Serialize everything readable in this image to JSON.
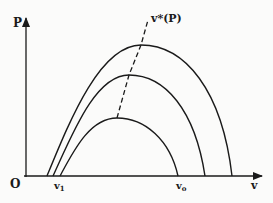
{
  "diagram": {
    "type": "family-of-curves",
    "axes": {
      "y_label": "P",
      "x_label": "v",
      "origin_label": "O"
    },
    "x_ticks": [
      {
        "label": "v",
        "subscript": "1"
      },
      {
        "label": "v",
        "subscript": "o"
      }
    ],
    "locus_label": "v*(P)",
    "curves": [
      {
        "name": "inner-curve",
        "start": "v1",
        "end": "vo"
      },
      {
        "name": "middle-curve"
      },
      {
        "name": "outer-curve"
      }
    ],
    "locus_style": "dashed",
    "colors": {
      "ink": "#1a1a1a",
      "background": "#fbfbfa"
    }
  }
}
